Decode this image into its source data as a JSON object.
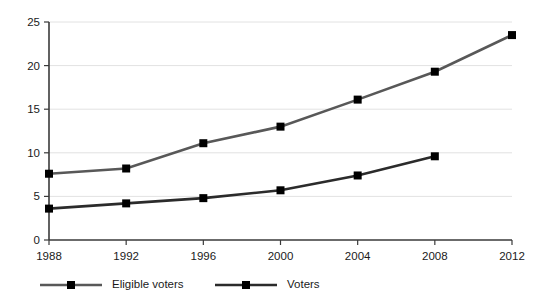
{
  "chart_data": {
    "type": "line",
    "title": "",
    "subtitle": "",
    "xlabel": "",
    "ylabel": "",
    "x": [
      1988,
      1992,
      1996,
      2000,
      2004,
      2008,
      2012
    ],
    "categories": [
      "1988",
      "1992",
      "1996",
      "2000",
      "2004",
      "2008",
      "2012"
    ],
    "xlim": [
      1988,
      2012
    ],
    "ylim": [
      0,
      25
    ],
    "y_ticks": [
      0,
      5,
      10,
      15,
      20,
      25
    ],
    "x_ticks": [
      1988,
      1992,
      1996,
      2000,
      2004,
      2008,
      2012
    ],
    "grid": true,
    "legend_position": "bottom",
    "series": [
      {
        "name": "Eligible voters",
        "color": "#585858",
        "marker": "square",
        "x": [
          1988,
          1992,
          1996,
          2000,
          2004,
          2008,
          2012
        ],
        "values": [
          7.6,
          8.2,
          11.1,
          13.0,
          16.1,
          19.3,
          23.5
        ]
      },
      {
        "name": "Voters",
        "color": "#2b2b2b",
        "marker": "square",
        "x": [
          1988,
          1992,
          1996,
          2000,
          2004,
          2008
        ],
        "values": [
          3.6,
          4.2,
          4.8,
          5.7,
          7.4,
          9.6
        ]
      }
    ]
  },
  "axes": {
    "y_tick_labels": [
      "25",
      "20",
      "15",
      "10",
      "5",
      "0"
    ],
    "x_tick_labels": [
      "1988",
      "1992",
      "1996",
      "2000",
      "2004",
      "2008",
      "2012"
    ]
  },
  "legend": {
    "items": [
      {
        "label": "Eligible voters",
        "color": "#585858"
      },
      {
        "label": "Voters",
        "color": "#2b2b2b"
      }
    ]
  },
  "colors": {
    "background": "#ffffff",
    "grid": "#e2e2e2",
    "axis": "#3a3a3a",
    "eligible_voters": "#585858",
    "voters": "#2b2b2b",
    "marker": "#000000",
    "text": "#1a1a1a"
  }
}
